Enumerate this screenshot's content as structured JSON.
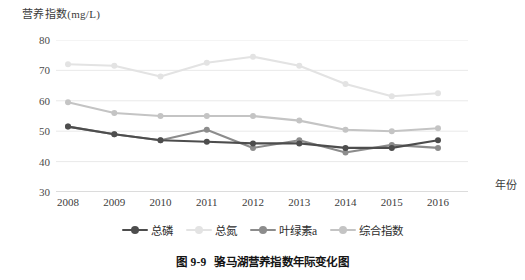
{
  "figure": {
    "caption_number": "图 9-9",
    "caption_text": "骆马湖营养指数年际变化图"
  },
  "axes": {
    "y_title": "营养指数(mg/L)",
    "x_title": "年份"
  },
  "chart_data": {
    "type": "line",
    "title": "骆马湖营养指数年际变化图",
    "xlabel": "年份",
    "ylabel": "营养指数(mg/L)",
    "categories": [
      "2008",
      "2009",
      "2010",
      "2011",
      "2012",
      "2013",
      "2014",
      "2015",
      "2016"
    ],
    "ylim": [
      30,
      80
    ],
    "yticks": [
      30,
      40,
      50,
      60,
      70,
      80
    ],
    "grid": "horizontal",
    "legend_position": "bottom",
    "series": [
      {
        "name": "总磷",
        "color": "#4d4d4d",
        "values": [
          51.5,
          49.0,
          47.0,
          46.5,
          46.0,
          46.0,
          44.5,
          44.5,
          47.0
        ]
      },
      {
        "name": "总氮",
        "color": "#e3e3e3",
        "values": [
          72.0,
          71.5,
          68.0,
          72.5,
          74.5,
          71.5,
          65.5,
          61.5,
          62.5
        ]
      },
      {
        "name": "叶绿素a",
        "color": "#8c8c8c",
        "values": [
          51.5,
          49.0,
          47.0,
          50.5,
          44.5,
          47.0,
          43.0,
          45.5,
          44.5
        ]
      },
      {
        "name": "综合指数",
        "color": "#c4c4c4",
        "values": [
          59.5,
          56.0,
          55.0,
          55.0,
          55.0,
          53.5,
          50.5,
          50.0,
          51.0
        ]
      }
    ]
  },
  "legend": {
    "items": [
      {
        "label": "总磷",
        "color": "#4d4d4d"
      },
      {
        "label": "总氮",
        "color": "#e3e3e3"
      },
      {
        "label": "叶绿素a",
        "color": "#8c8c8c"
      },
      {
        "label": "综合指数",
        "color": "#c4c4c4"
      }
    ]
  }
}
